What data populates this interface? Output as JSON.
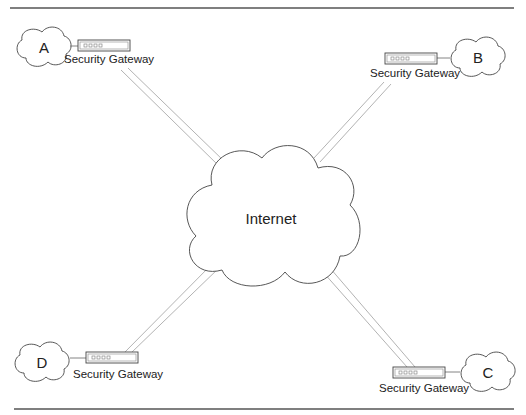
{
  "diagram": {
    "center": {
      "label": "Internet"
    },
    "sites": [
      {
        "id": "A",
        "label": "A",
        "gateway_label": "Security Gateway"
      },
      {
        "id": "B",
        "label": "B",
        "gateway_label": "Security Gateway"
      },
      {
        "id": "C",
        "label": "C",
        "gateway_label": "Security Gateway"
      },
      {
        "id": "D",
        "label": "D",
        "gateway_label": "Security Gateway"
      }
    ],
    "connections": [
      {
        "from": "A",
        "to": "Internet",
        "style": "double-line"
      },
      {
        "from": "B",
        "to": "Internet",
        "style": "double-line"
      },
      {
        "from": "C",
        "to": "Internet",
        "style": "double-line"
      },
      {
        "from": "D",
        "to": "Internet",
        "style": "double-line"
      }
    ]
  },
  "colors": {
    "line": "#aaaaaa",
    "outline": "#444444",
    "rule": "#555555",
    "background": "#ffffff"
  }
}
